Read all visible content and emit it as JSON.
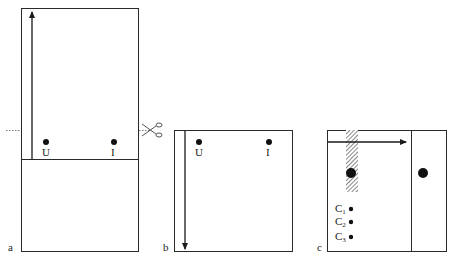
{
  "panels": {
    "a": {
      "label": "a",
      "points": [
        {
          "label": "U"
        },
        {
          "label": "I"
        }
      ]
    },
    "b": {
      "label": "b",
      "points": [
        {
          "label": "U"
        },
        {
          "label": "I"
        }
      ]
    },
    "c": {
      "label": "c",
      "cells": [
        {
          "letter": "C",
          "sub": "1"
        },
        {
          "letter": "C",
          "sub": "2"
        },
        {
          "letter": "C",
          "sub": "3"
        }
      ]
    }
  },
  "icons": {
    "scissors": "scissors-icon"
  },
  "colors": {
    "line": "#2a2a2a",
    "hatch": "#6a6a6a"
  }
}
